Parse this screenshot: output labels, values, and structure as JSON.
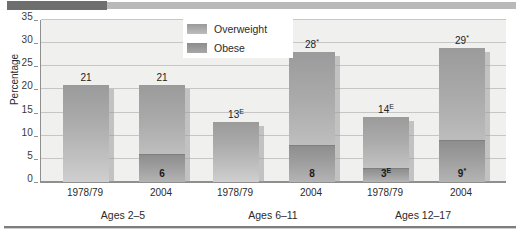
{
  "chart_data": {
    "type": "bar",
    "title": "",
    "xlabel": "",
    "ylabel": "Percentage",
    "ylim": [
      0,
      35
    ],
    "ytick_values": [
      0,
      5,
      10,
      15,
      20,
      25,
      30,
      35
    ],
    "ytick_labels": [
      "0",
      "5",
      "10",
      "15",
      "20",
      "25",
      "30",
      "35"
    ],
    "grid": true,
    "legend_position": "top-center",
    "stacked": true,
    "categories": [
      "1978/79",
      "2004",
      "1978/79",
      "2004",
      "1978/79",
      "2004"
    ],
    "groups": [
      {
        "label": "Ages 2–5",
        "bars": [
          {
            "category": "1978/79",
            "total": 21,
            "total_label": "21",
            "total_marker": "",
            "obese": 0,
            "obese_label": "",
            "obese_marker": "",
            "overweight": 21
          },
          {
            "category": "2004",
            "total": 21,
            "total_label": "21",
            "total_marker": "",
            "obese": 6,
            "obese_label": "6",
            "obese_marker": "",
            "overweight": 15
          }
        ]
      },
      {
        "label": "Ages 6–11",
        "bars": [
          {
            "category": "1978/79",
            "total": 13,
            "total_label": "13",
            "total_marker": "E",
            "obese": 0,
            "obese_label": "",
            "obese_marker": "",
            "overweight": 13
          },
          {
            "category": "2004",
            "total": 28,
            "total_label": "28",
            "total_marker": "*",
            "obese": 8,
            "obese_label": "8",
            "obese_marker": "",
            "overweight": 20
          }
        ]
      },
      {
        "label": "Ages 12–17",
        "bars": [
          {
            "category": "1978/79",
            "total": 14,
            "total_label": "14",
            "total_marker": "E",
            "obese": 3,
            "obese_label": "3",
            "obese_marker": "E",
            "overweight": 11
          },
          {
            "category": "2004",
            "total": 29,
            "total_label": "29",
            "total_marker": "*",
            "obese": 9,
            "obese_label": "9",
            "obese_marker": "*",
            "overweight": 20
          }
        ]
      }
    ],
    "series": [
      {
        "name": "Overweight",
        "values": [
          21,
          15,
          13,
          20,
          11,
          20
        ]
      },
      {
        "name": "Obese",
        "values": [
          0,
          6,
          0,
          8,
          3,
          9
        ]
      }
    ],
    "legend": [
      {
        "label": "Overweight",
        "color": "#a8a8a8"
      },
      {
        "label": "Obese",
        "color": "#8e8e8e"
      }
    ]
  },
  "colors": {
    "plot_background": "#f0f0ef",
    "gridline": "#c6c6c6",
    "axis": "#8f8f8f",
    "bar_overweight_top": "#9b9b9b",
    "bar_overweight_bottom": "#cfcfcf",
    "bar_obese_top": "#8e8e8e",
    "bar_obese_bottom": "#b4b4b4",
    "header_rule_dark": "#6e6e6e",
    "header_rule_light": "#b9b9b9",
    "footer_rule": "#7d7d7d",
    "text": "#2b2b2b"
  }
}
